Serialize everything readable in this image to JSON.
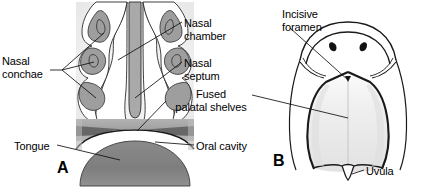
{
  "figure": {
    "background_color": "#ffffff",
    "width": 428,
    "height": 190
  },
  "panels": [
    {
      "id": "A",
      "letter": "A",
      "view": "coronal-section-through-nasal-and-oral-cavities",
      "letter_x": 57,
      "letter_y": 159
    },
    {
      "id": "B",
      "letter": "B",
      "view": "inferior-view-of-fused-palate",
      "letter_x": 273,
      "letter_y": 152
    }
  ],
  "labels": [
    {
      "name": "nasal-conchae",
      "text_lines": [
        "Nasal",
        "conchae"
      ],
      "x": 2,
      "y": 55,
      "align": "left",
      "panel": "A"
    },
    {
      "name": "nasal-chamber",
      "text_lines": [
        "Nasal",
        "chamber"
      ],
      "x": 184,
      "y": 17,
      "align": "left",
      "panel": "A"
    },
    {
      "name": "nasal-septum",
      "text_lines": [
        "Nasal",
        "septum"
      ],
      "x": 184,
      "y": 57,
      "align": "left",
      "panel": "A"
    },
    {
      "name": "fused-palatal-shelves",
      "text_lines": [
        "Fused",
        "palatal shelves"
      ],
      "x": 168,
      "y": 88,
      "align": "left",
      "panel": "A"
    },
    {
      "name": "tongue",
      "text_lines": [
        "Tongue"
      ],
      "x": 14,
      "y": 140,
      "align": "left",
      "panel": "A"
    },
    {
      "name": "oral-cavity",
      "text_lines": [
        "Oral cavity"
      ],
      "x": 196,
      "y": 140,
      "align": "left",
      "panel": "A"
    },
    {
      "name": "incisive-foramen",
      "text_lines": [
        "Incisive",
        "foramen"
      ],
      "x": 282,
      "y": 8,
      "align": "left",
      "panel": "B"
    },
    {
      "name": "uvula",
      "text_lines": [
        "Uvula"
      ],
      "x": 366,
      "y": 165,
      "align": "left",
      "panel": "B"
    }
  ],
  "colors": {
    "outline": "#1a1a1a",
    "leader_line": "#111111",
    "mucosa_gray": "#9a9a9a",
    "light_gray": "#d8d8d8",
    "pale_gray": "#eeeeee",
    "palatal_shelf_gray": "#a8a8a8",
    "palatal_shelf_dark": "#6e6e6e",
    "tongue_gray": "#8c8c8c",
    "nostril_black": "#111111",
    "panel_b_fill": "#f4f4f4",
    "text_color": "#000000"
  },
  "structures_panel_a": [
    "nasal septum",
    "left nasal chamber",
    "right nasal chamber",
    "superior nasal concha",
    "middle nasal concha",
    "inferior nasal concha",
    "fused palatal shelves",
    "oral cavity",
    "tongue"
  ],
  "structures_panel_b": [
    "external nares",
    "incisive foramen",
    "hard palate",
    "soft palate",
    "uvula",
    "cheek contour"
  ]
}
